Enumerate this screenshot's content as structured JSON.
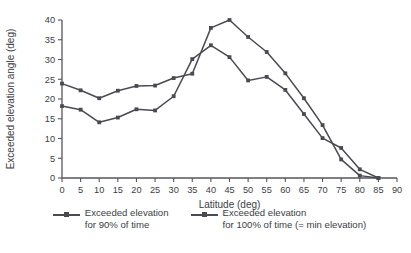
{
  "chart_data": {
    "type": "line",
    "title": "",
    "xlabel": "Latitude (deg)",
    "ylabel": "Exceeded elevation angle (deg)",
    "xlim": [
      0,
      90
    ],
    "ylim": [
      0,
      40
    ],
    "xticks": [
      0,
      5,
      10,
      15,
      20,
      25,
      30,
      35,
      40,
      45,
      50,
      55,
      60,
      65,
      70,
      75,
      80,
      85,
      90
    ],
    "yticks": [
      0,
      5,
      10,
      15,
      20,
      25,
      30,
      35,
      40
    ],
    "xtick_labels": [
      "0",
      "5",
      "10",
      "15",
      "20",
      "25",
      "30",
      "35",
      "40",
      "45",
      "50",
      "55",
      "60",
      "65",
      "70",
      "75",
      "80",
      "85",
      "90"
    ],
    "ytick_labels": [
      "0",
      "5",
      "10",
      "15",
      "20",
      "25",
      "30",
      "35",
      "40"
    ],
    "grid": false,
    "legend_position": "below",
    "line_color": "#4a4a52",
    "marker": "square",
    "x": [
      0,
      5,
      10,
      15,
      20,
      25,
      30,
      35,
      40,
      45,
      50,
      55,
      60,
      65,
      70,
      75,
      80,
      85
    ],
    "series": [
      {
        "name": "Exceeded elevation for 90% of time",
        "legend_line1": "Exceeded elevation",
        "legend_line2": "for 90% of time",
        "values": [
          23.9,
          22.2,
          20.2,
          22.1,
          23.3,
          23.4,
          25.3,
          26.4,
          38.0,
          40.0,
          35.7,
          31.9,
          26.5,
          20.2,
          13.4,
          4.7,
          0.6,
          0.0
        ]
      },
      {
        "name": "Exceeded elevation for 100% of time (= min elevation)",
        "legend_line1": "Exceeded elevation",
        "legend_line2": "for 100% of time (= min elevation)",
        "values": [
          18.2,
          17.3,
          14.1,
          15.3,
          17.4,
          17.1,
          20.7,
          30.1,
          33.6,
          30.6,
          24.7,
          25.6,
          22.3,
          16.2,
          10.1,
          7.6,
          2.2,
          0.0
        ]
      }
    ]
  }
}
